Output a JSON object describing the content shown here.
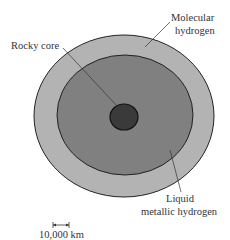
{
  "diagram": {
    "colors": {
      "outer_layer": "#b3b3b3",
      "inner_layer": "#808080",
      "core": "#3a3a3a",
      "outline": "#222222"
    },
    "labels": {
      "molecular_line1": "Molecular",
      "molecular_line2": "hydrogen",
      "rocky_core": "Rocky core",
      "liquid_line1": "Liquid",
      "liquid_line2": "metallic hydrogen"
    },
    "scale_bar": {
      "label": "10,000 km"
    }
  }
}
